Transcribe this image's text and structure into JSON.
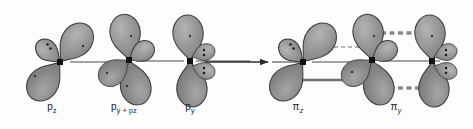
{
  "diagram": {
    "type": "orbital-diagram",
    "background_color": "#fdfdfd",
    "lobe_fill": "#8d8d8d",
    "lobe_fill_light": "#a3a3a3",
    "lobe_stroke": "#3c3c3c",
    "nucleus_color": "#1a1a1a",
    "axis_color": "#4a4a4a",
    "bond_solid_color": "#6e6e6e",
    "bond_dashed_color": "#8a8a8a",
    "label_color": "#1a1a1a",
    "arrow_color": "#2b2b2b"
  },
  "left_panel": {
    "name": "atomic-orbitals",
    "labels": [
      {
        "id": "label-pz",
        "text": "p",
        "sub": "z",
        "x": 52,
        "y": 108
      },
      {
        "id": "label-pypz",
        "text": "p",
        "sub": "y + pz",
        "x": 124,
        "y": 108
      },
      {
        "id": "label-py",
        "text": "p",
        "sub": "y",
        "x": 188,
        "y": 108
      }
    ],
    "label_pz_full": "pz",
    "label_pypz_full": "py + pz",
    "label_py_full": "py"
  },
  "right_panel": {
    "name": "pi-molecular-orbitals",
    "labels": [
      {
        "id": "label-piz",
        "text": "π",
        "sub": "z",
        "x": 298,
        "y": 108
      },
      {
        "id": "label-piy",
        "text": "π",
        "sub": "y",
        "x": 396,
        "y": 108
      }
    ],
    "label_piz_full": "πz",
    "label_piy_full": "πy"
  },
  "arrow": {
    "name": "transformation-arrow",
    "x1": 203,
    "y1": 62,
    "x2": 268,
    "y2": 62,
    "direction": "right"
  },
  "atoms": [
    {
      "id": "atom-1",
      "cx": 60,
      "cy": 62,
      "panel": "left",
      "orbital": "pz"
    },
    {
      "id": "atom-2",
      "cx": 129,
      "cy": 60,
      "panel": "left",
      "orbital": "py + pz"
    },
    {
      "id": "atom-3",
      "cx": 190,
      "cy": 61,
      "panel": "left",
      "orbital": "py"
    },
    {
      "id": "atom-4",
      "cx": 303,
      "cy": 62,
      "panel": "right",
      "orbital": "pi-z"
    },
    {
      "id": "atom-5",
      "cx": 372,
      "cy": 60,
      "panel": "right",
      "orbital": "pi-z / pi-y"
    },
    {
      "id": "atom-6",
      "cx": 432,
      "cy": 61,
      "panel": "right",
      "orbital": "pi-y"
    }
  ],
  "electron_pairs": [
    {
      "id": "lone-pair-1",
      "atom": "atom-1",
      "dots": 2
    },
    {
      "id": "lone-pair-2",
      "atom": "atom-3",
      "dots": 4
    },
    {
      "id": "lone-pair-3",
      "atom": "atom-4",
      "dots": 2
    },
    {
      "id": "lone-pair-4",
      "atom": "atom-6",
      "dots": 4
    }
  ],
  "bonds": [
    {
      "id": "sigma-bond-1",
      "style": "solid",
      "x1": 72,
      "y1": 62,
      "x2": 118,
      "y2": 62
    },
    {
      "id": "sigma-bond-2",
      "style": "solid",
      "x1": 140,
      "y1": 61,
      "x2": 180,
      "y2": 61
    },
    {
      "id": "sigma-bond-3",
      "style": "solid",
      "x1": 200,
      "y1": 61,
      "x2": 246,
      "y2": 61
    },
    {
      "id": "pi-bond-lower-1",
      "style": "solid-bar",
      "x1": 285,
      "y1": 80,
      "x2": 355,
      "y2": 80
    },
    {
      "id": "pi-bond-upper-1",
      "style": "thin-dashed",
      "x1": 322,
      "y1": 47,
      "x2": 366,
      "y2": 47
    },
    {
      "id": "pi-bond-top-2",
      "style": "thick-dashed",
      "x1": 383,
      "y1": 33,
      "x2": 428,
      "y2": 33
    },
    {
      "id": "pi-bond-bottom-2",
      "style": "thick-dashed",
      "x1": 383,
      "y1": 88,
      "x2": 428,
      "y2": 88
    }
  ]
}
